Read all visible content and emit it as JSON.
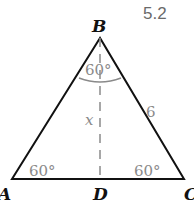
{
  "figure": {
    "number": "5.2",
    "vertices": {
      "top": "B",
      "left": "A",
      "right": "C",
      "foot": "D"
    },
    "angles": {
      "B": "60°",
      "A": "60°",
      "C": "60°"
    },
    "side_BC": "6",
    "altitude_label": "x"
  },
  "colors": {
    "lines": "#111111",
    "labels": "#8a8a8a",
    "dashed": "#8a8a8a"
  }
}
